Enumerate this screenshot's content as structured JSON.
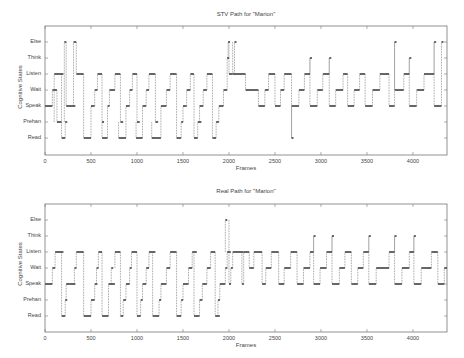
{
  "chart_data": [
    {
      "type": "line",
      "subtype": "step",
      "title": "STV Path for \"Marion\"",
      "xlabel": "Frames",
      "ylabel": "Cognitive States",
      "xlim": [
        0,
        4370
      ],
      "xticks": [
        0,
        500,
        1000,
        1500,
        2000,
        2500,
        3000,
        3500,
        4000
      ],
      "yticks": [
        "Read",
        "Prehan",
        "Speak",
        "Wait",
        "Listen",
        "Think",
        "Else"
      ],
      "grid": false,
      "segments": [
        [
          0,
          80,
          2
        ],
        [
          80,
          130,
          3
        ],
        [
          130,
          180,
          1
        ],
        [
          100,
          200,
          4
        ],
        [
          180,
          220,
          0
        ],
        [
          220,
          230,
          1
        ],
        [
          210,
          230,
          6
        ],
        [
          230,
          330,
          2
        ],
        [
          310,
          340,
          6
        ],
        [
          340,
          420,
          4
        ],
        [
          420,
          500,
          0
        ],
        [
          500,
          540,
          2
        ],
        [
          540,
          570,
          3
        ],
        [
          570,
          620,
          4
        ],
        [
          620,
          640,
          1
        ],
        [
          620,
          680,
          0
        ],
        [
          680,
          700,
          2
        ],
        [
          700,
          760,
          3
        ],
        [
          760,
          820,
          4
        ],
        [
          820,
          850,
          1
        ],
        [
          800,
          880,
          0
        ],
        [
          880,
          920,
          2
        ],
        [
          920,
          950,
          3
        ],
        [
          950,
          1000,
          4
        ],
        [
          1000,
          1030,
          1
        ],
        [
          990,
          1060,
          0
        ],
        [
          1060,
          1100,
          2
        ],
        [
          1100,
          1130,
          3
        ],
        [
          1130,
          1200,
          4
        ],
        [
          1200,
          1230,
          1
        ],
        [
          1160,
          1260,
          0
        ],
        [
          1260,
          1320,
          2
        ],
        [
          1320,
          1360,
          3
        ],
        [
          1360,
          1430,
          4
        ],
        [
          1430,
          1480,
          0
        ],
        [
          1480,
          1500,
          1
        ],
        [
          1500,
          1540,
          2
        ],
        [
          1540,
          1580,
          3
        ],
        [
          1580,
          1620,
          4
        ],
        [
          1620,
          1660,
          0
        ],
        [
          1660,
          1700,
          1
        ],
        [
          1680,
          1720,
          2
        ],
        [
          1720,
          1760,
          3
        ],
        [
          1760,
          1820,
          4
        ],
        [
          1820,
          1860,
          0
        ],
        [
          1860,
          1890,
          1
        ],
        [
          1890,
          1940,
          2
        ],
        [
          1940,
          1980,
          3
        ],
        [
          1980,
          2000,
          5
        ],
        [
          1990,
          2010,
          6
        ],
        [
          2000,
          2040,
          4
        ],
        [
          2060,
          2080,
          6
        ],
        [
          2040,
          2180,
          4
        ],
        [
          2180,
          2320,
          3
        ],
        [
          2320,
          2390,
          2
        ],
        [
          2390,
          2430,
          3
        ],
        [
          2430,
          2500,
          4
        ],
        [
          2500,
          2560,
          2
        ],
        [
          2560,
          2600,
          3
        ],
        [
          2600,
          2680,
          4
        ],
        [
          2680,
          2700,
          0
        ],
        [
          2680,
          2760,
          2
        ],
        [
          2760,
          2820,
          3
        ],
        [
          2820,
          2880,
          4
        ],
        [
          2880,
          2900,
          5
        ],
        [
          2880,
          2960,
          2
        ],
        [
          2960,
          3020,
          3
        ],
        [
          3020,
          3090,
          4
        ],
        [
          3090,
          3110,
          5
        ],
        [
          3090,
          3160,
          2
        ],
        [
          3160,
          3240,
          3
        ],
        [
          3240,
          3290,
          4
        ],
        [
          3290,
          3360,
          2
        ],
        [
          3360,
          3420,
          3
        ],
        [
          3420,
          3480,
          4
        ],
        [
          3480,
          3560,
          2
        ],
        [
          3560,
          3640,
          3
        ],
        [
          3640,
          3740,
          4
        ],
        [
          3740,
          3800,
          2
        ],
        [
          3800,
          3820,
          6
        ],
        [
          3800,
          3900,
          3
        ],
        [
          3900,
          3960,
          4
        ],
        [
          3960,
          3980,
          5
        ],
        [
          3960,
          4040,
          2
        ],
        [
          4040,
          4120,
          3
        ],
        [
          4120,
          4230,
          4
        ],
        [
          4230,
          4250,
          6
        ],
        [
          4230,
          4310,
          2
        ],
        [
          4310,
          4330,
          6
        ]
      ]
    },
    {
      "type": "line",
      "subtype": "step",
      "title": "Real Path for \"Marion\"",
      "xlabel": "Frames",
      "ylabel": "Cognitive States",
      "xlim": [
        0,
        4370
      ],
      "xticks": [
        0,
        500,
        1000,
        1500,
        2000,
        2500,
        3000,
        3500,
        4000
      ],
      "yticks": [
        "Read",
        "Prehan",
        "Speak",
        "Wait",
        "Listen",
        "Think",
        "Else"
      ],
      "grid": false,
      "segments": [
        [
          0,
          80,
          2
        ],
        [
          80,
          110,
          3
        ],
        [
          110,
          200,
          4
        ],
        [
          180,
          220,
          0
        ],
        [
          220,
          240,
          1
        ],
        [
          230,
          330,
          2
        ],
        [
          320,
          340,
          3
        ],
        [
          340,
          420,
          4
        ],
        [
          420,
          500,
          0
        ],
        [
          500,
          540,
          1
        ],
        [
          540,
          570,
          2
        ],
        [
          560,
          580,
          3
        ],
        [
          580,
          620,
          4
        ],
        [
          620,
          690,
          0
        ],
        [
          690,
          760,
          2
        ],
        [
          720,
          740,
          3
        ],
        [
          760,
          820,
          4
        ],
        [
          820,
          850,
          0
        ],
        [
          850,
          880,
          1
        ],
        [
          880,
          920,
          2
        ],
        [
          920,
          940,
          3
        ],
        [
          940,
          1000,
          4
        ],
        [
          1000,
          1040,
          0
        ],
        [
          1040,
          1060,
          1
        ],
        [
          1060,
          1100,
          2
        ],
        [
          1100,
          1130,
          3
        ],
        [
          1130,
          1200,
          4
        ],
        [
          1170,
          1240,
          0
        ],
        [
          1240,
          1260,
          1
        ],
        [
          1260,
          1320,
          2
        ],
        [
          1320,
          1360,
          3
        ],
        [
          1360,
          1430,
          4
        ],
        [
          1430,
          1480,
          0
        ],
        [
          1480,
          1500,
          1
        ],
        [
          1500,
          1560,
          2
        ],
        [
          1560,
          1600,
          3
        ],
        [
          1600,
          1650,
          4
        ],
        [
          1620,
          1680,
          0
        ],
        [
          1680,
          1710,
          1
        ],
        [
          1710,
          1760,
          2
        ],
        [
          1760,
          1800,
          3
        ],
        [
          1800,
          1850,
          4
        ],
        [
          1850,
          1900,
          0
        ],
        [
          1880,
          1900,
          1
        ],
        [
          1900,
          1960,
          2
        ],
        [
          1960,
          1980,
          3
        ],
        [
          1980,
          2020,
          4
        ],
        [
          1960,
          1980,
          6
        ],
        [
          2000,
          2020,
          2
        ],
        [
          2020,
          2040,
          3
        ],
        [
          2040,
          2160,
          4
        ],
        [
          2140,
          2160,
          2
        ],
        [
          2160,
          2220,
          4
        ],
        [
          2220,
          2270,
          3
        ],
        [
          2270,
          2360,
          4
        ],
        [
          2360,
          2400,
          2
        ],
        [
          2400,
          2460,
          3
        ],
        [
          2460,
          2540,
          4
        ],
        [
          2540,
          2600,
          2
        ],
        [
          2600,
          2670,
          3
        ],
        [
          2670,
          2740,
          4
        ],
        [
          2740,
          2810,
          2
        ],
        [
          2810,
          2880,
          3
        ],
        [
          2880,
          2920,
          4
        ],
        [
          2920,
          2940,
          5
        ],
        [
          2920,
          2990,
          2
        ],
        [
          2990,
          3060,
          3
        ],
        [
          3060,
          3120,
          4
        ],
        [
          3120,
          3140,
          5
        ],
        [
          3120,
          3200,
          2
        ],
        [
          3200,
          3260,
          3
        ],
        [
          3260,
          3330,
          4
        ],
        [
          3330,
          3400,
          2
        ],
        [
          3400,
          3460,
          3
        ],
        [
          3460,
          3520,
          4
        ],
        [
          3520,
          3540,
          5
        ],
        [
          3520,
          3600,
          2
        ],
        [
          3600,
          3740,
          3
        ],
        [
          3740,
          3800,
          4
        ],
        [
          3800,
          3820,
          5
        ],
        [
          3800,
          3880,
          2
        ],
        [
          3880,
          3960,
          3
        ],
        [
          3960,
          4010,
          4
        ],
        [
          4010,
          4030,
          5
        ],
        [
          4010,
          4090,
          2
        ],
        [
          4090,
          4200,
          3
        ],
        [
          4200,
          4270,
          4
        ],
        [
          4270,
          4340,
          2
        ],
        [
          4340,
          4370,
          3
        ]
      ]
    }
  ],
  "panels": {
    "top": {
      "title": "STV Path for \"Marion\"",
      "xlabel": "Frames",
      "ylabel": "Cognitive States"
    },
    "bottom": {
      "title": "Real Path for \"Marion\"",
      "xlabel": "Frames",
      "ylabel": "Cognitive States"
    }
  },
  "colors": {
    "line": "#555555",
    "marker": "#666666",
    "axis": "#777777",
    "text": "#444444"
  }
}
